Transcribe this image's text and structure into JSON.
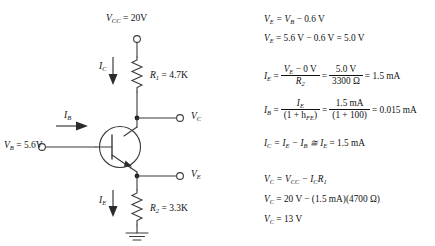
{
  "circuit": {
    "title": "NPN common-collector / emitter-follower bias circuit",
    "supply_label": "V",
    "labels": {
      "vcc": "V_CC = 20V",
      "vcc_sym": "V",
      "vcc_sub": "CC",
      "vcc_val": " = 20V",
      "r1_sym": "R",
      "r1_sub": "1",
      "r1_val": " = 4.7K",
      "r2_sym": "R",
      "r2_sub": "2",
      "r2_val": " = 3.3K",
      "ic_sym": "I",
      "ic_sub": "C",
      "ib_sym": "I",
      "ib_sub": "B",
      "ie_sym": "I",
      "ie_sub": "E",
      "vb_sym": "V",
      "vb_sub": "B",
      "vb_val": " = 5.6V",
      "vc_sym": "V",
      "vc_sub": "C",
      "ve_sym": "V",
      "ve_sub": "E"
    },
    "components": [
      {
        "name": "vcc-terminal",
        "type": "open-terminal"
      },
      {
        "name": "resistor-r1",
        "type": "resistor",
        "value": "4.7K"
      },
      {
        "name": "resistor-r2",
        "type": "resistor",
        "value": "3.3K"
      },
      {
        "name": "transistor-q1",
        "type": "npn-bjt"
      },
      {
        "name": "ground",
        "type": "ground"
      },
      {
        "name": "vb-terminal",
        "type": "open-terminal"
      },
      {
        "name": "vc-terminal",
        "type": "open-terminal"
      },
      {
        "name": "ve-terminal",
        "type": "open-terminal"
      }
    ],
    "colors": {
      "wire": "#3a3a3a",
      "arrow": "#2b2b2b",
      "text": "#111111",
      "background": "#ffffff"
    }
  },
  "equations": {
    "e1": {
      "lhs_sym": "V",
      "lhs_sub": "E",
      "rhs": " = V",
      "rhs_sub": "B",
      "tail": " − 0.6 V"
    },
    "e2": {
      "lhs_sym": "V",
      "lhs_sub": "E",
      "text": " = 5.6 V − 0.6 V = 5.0 V"
    },
    "e3": {
      "lhs_sym": "I",
      "lhs_sub": "E",
      "num1_pre": "V",
      "num1_sub": "E",
      "num1_post": " − 0 V",
      "den1_sym": "R",
      "den1_sub": "2",
      "num2": "5.0 V",
      "den2": "3300 Ω",
      "result": " = 1.5 mA"
    },
    "e4": {
      "lhs_sym": "I",
      "lhs_sub": "B",
      "num1_sym": "I",
      "num1_sub": "E",
      "den1_pre": "(1 + h",
      "den1_sub": "FE",
      "den1_post": ")",
      "num2": "1.5 mA",
      "den2": "(1 + 100)",
      "result": " = 0.015 mA"
    },
    "e5": {
      "lhs_sym": "I",
      "lhs_sub": "C",
      "text_a": " = I",
      "sub_a": "E",
      "text_b": " − I",
      "sub_b": "B",
      "text_c": " ≅ I",
      "sub_c": "E",
      "tail": " = 1.5 mA"
    },
    "e6": {
      "lhs_sym": "V",
      "lhs_sub": "C",
      "text_a": " = V",
      "sub_a": "CC",
      "text_b": " − I",
      "sub_b": "C",
      "text_c": "R",
      "sub_c": "1"
    },
    "e7": {
      "lhs_sym": "V",
      "lhs_sub": "C",
      "text": " = 20 V − (1.5 mA)(4700 Ω)"
    },
    "e8": {
      "lhs_sym": "V",
      "lhs_sub": "C",
      "text": " = 13 V"
    }
  }
}
